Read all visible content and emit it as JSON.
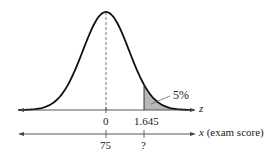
{
  "chart_data": {
    "type": "area",
    "title": "",
    "z_axis": {
      "label": "z",
      "ticks": [
        {
          "pos": 0,
          "label": "0"
        },
        {
          "pos": 1.645,
          "label": "1.645"
        }
      ]
    },
    "x_axis": {
      "label": "x (exam score)",
      "ticks": [
        {
          "pos": 0,
          "label": "75"
        },
        {
          "pos": 1.645,
          "label": "?"
        }
      ]
    },
    "shaded_region": {
      "from_z": 1.645,
      "to_z": "inf",
      "area_label": "5%"
    },
    "mean": 0,
    "sd": 1
  },
  "labels": {
    "z_axis_name": "z",
    "x_axis_name_var": "x",
    "x_axis_name_desc": "(exam score)",
    "z_tick_0": "0",
    "z_tick_1": "1.645",
    "x_tick_0": "75",
    "x_tick_1": "?",
    "tail_area": "5%"
  },
  "colors": {
    "curve": "#111111",
    "shade": "#b8b8b8",
    "axis": "#444444"
  }
}
